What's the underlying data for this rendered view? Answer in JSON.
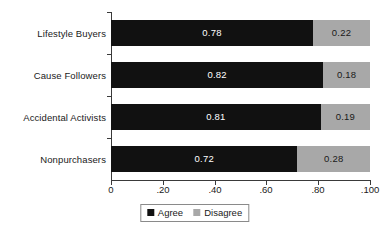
{
  "chart_data": {
    "type": "bar",
    "orientation": "horizontal",
    "stacked": true,
    "title": "",
    "subtitle": "",
    "xlabel": "",
    "ylabel": "",
    "categories": [
      "Lifestyle Buyers",
      "Cause Followers",
      "Accidental Activists",
      "Nonpurchasers"
    ],
    "series": [
      {
        "name": "Agree",
        "color": "#111111",
        "values": [
          0.78,
          0.82,
          0.81,
          0.72
        ]
      },
      {
        "name": "Disagree",
        "color": "#a8a8a8",
        "values": [
          0.22,
          0.18,
          0.19,
          0.28
        ]
      }
    ],
    "data_labels": [
      {
        "category": "Lifestyle Buyers",
        "agree": "0.78",
        "disagree": "0.22"
      },
      {
        "category": "Cause Followers",
        "agree": "0.82",
        "disagree": "0.18"
      },
      {
        "category": "Accidental Activists",
        "agree": "0.81",
        "disagree": "0.19"
      },
      {
        "category": "Nonpurchasers",
        "agree": "0.72",
        "disagree": "0.28"
      }
    ],
    "xlim": [
      0,
      1
    ],
    "xticks": [
      0,
      0.2,
      0.4,
      0.6,
      0.8,
      1.0
    ],
    "xtick_labels": [
      "0",
      ".20",
      ".40",
      ".60",
      ".80",
      ".100"
    ],
    "grid": false,
    "legend_position": "bottom-center",
    "legend_entries": [
      "Agree",
      "Disagree"
    ],
    "annotations": []
  },
  "legend": {
    "agree_label": "Agree",
    "disagree_label": "Disagree"
  },
  "colors": {
    "agree": "#111111",
    "disagree": "#a8a8a8",
    "axis": "#3a3a3a",
    "text": "#1a1a1a",
    "background": "#ffffff"
  }
}
